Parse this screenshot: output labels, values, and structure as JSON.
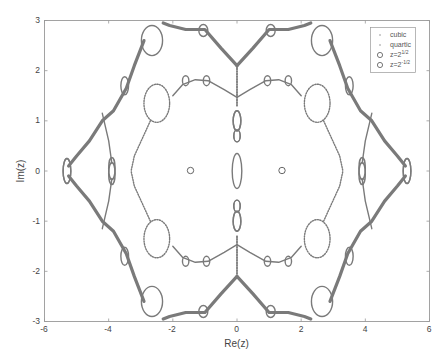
{
  "chart_data": {
    "type": "scatter",
    "title": "",
    "xlabel": "Re(z)",
    "ylabel": "Im(z)",
    "xlim": [
      -6,
      6
    ],
    "ylim": [
      -3,
      3
    ],
    "xticks": [
      -6,
      -4,
      -2,
      0,
      2,
      4,
      6
    ],
    "yticks": [
      -3,
      -2,
      -1,
      0,
      1,
      2,
      3
    ],
    "xtick_labels": [
      "-6",
      "-4",
      "-2",
      "0",
      "2",
      "4",
      "6"
    ],
    "ytick_labels": [
      "-3",
      "-2",
      "-1",
      "0",
      "1",
      "2",
      "3"
    ],
    "grid": false,
    "legend_position": "upper right",
    "legend": [
      {
        "label": "cubic",
        "marker": "dot"
      },
      {
        "label": "quartic",
        "marker": "dot"
      },
      {
        "label": "z=2^{1/2}",
        "marker": "circle"
      },
      {
        "label": "z=2^{-1/2}",
        "marker": "circle"
      }
    ],
    "series": [
      {
        "name": "cubic",
        "description": "Dense point clouds tracing an outer hexagon-like boundary with lobes",
        "outer_boundary_vertices": [
          [
            -5.3,
            0
          ],
          [
            -4.2,
            1.15
          ],
          [
            -2.75,
            2.85
          ],
          [
            -1.0,
            2.85
          ],
          [
            0,
            2.1
          ],
          [
            1.0,
            2.85
          ],
          [
            2.75,
            2.85
          ],
          [
            4.2,
            1.15
          ],
          [
            5.3,
            0
          ],
          [
            4.2,
            -1.15
          ],
          [
            2.75,
            -2.85
          ],
          [
            1.0,
            -2.85
          ],
          [
            0,
            -2.1
          ],
          [
            -1.0,
            -2.85
          ],
          [
            -2.75,
            -2.85
          ],
          [
            -4.2,
            -1.15
          ]
        ]
      },
      {
        "name": "quartic",
        "description": "Thinner curves forming two inner loops around ±sqrt(2) and a central vertical chain on Re(z)=0",
        "inner_loop_points": [
          [
            0,
            1.45
          ],
          [
            -1.2,
            1.85
          ],
          [
            -2.3,
            1.5
          ],
          [
            -3.2,
            0.6
          ],
          [
            -3.2,
            -0.6
          ],
          [
            -2.3,
            -1.5
          ],
          [
            -1.2,
            -1.85
          ],
          [
            0,
            -1.45
          ]
        ]
      },
      {
        "name": "z=2^{1/2}",
        "points": [
          [
            1.414,
            0
          ]
        ]
      },
      {
        "name": "z=2^{-1/2}",
        "points": [
          [
            -1.414,
            0
          ]
        ]
      }
    ]
  }
}
